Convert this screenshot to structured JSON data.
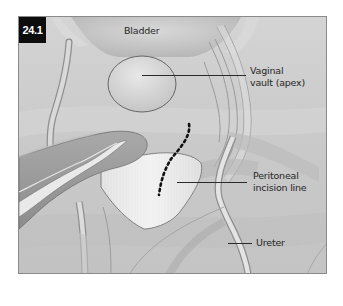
{
  "figure": {
    "number": "24.1",
    "colors": {
      "background": "#cfcfcf",
      "frame_border": "#8a8a8a",
      "badge_bg": "#0d0d0d",
      "badge_text": "#ffffff",
      "label_text": "#262626",
      "incision_dots": "#111111"
    },
    "labels": {
      "bladder": "Bladder",
      "vaginal_vault_line1": "Vaginal",
      "vaginal_vault_line2": "vault (apex)",
      "peritoneal_line1": "Peritoneal",
      "peritoneal_line2": "incision line",
      "ureter": "Ureter"
    },
    "structures": [
      "bladder",
      "vaginal-vault",
      "bowel-loop",
      "peritoneum-flap",
      "peritoneal-incision-line",
      "ureter-left",
      "ureter-right",
      "pelvic-vessels"
    ]
  }
}
